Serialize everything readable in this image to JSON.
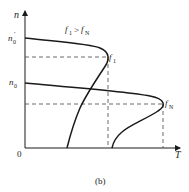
{
  "diagram": {
    "caption": "(b)",
    "axes": {
      "y_label": "n",
      "x_label": "T",
      "origin_label": "0"
    },
    "y_ticks": {
      "n0_prime": {
        "base": "n",
        "sub": "0",
        "sup": "′"
      },
      "n0": {
        "base": "n",
        "sub": "0"
      }
    },
    "condition": {
      "left": "f",
      "left_sub": "1",
      "op": ">",
      "right": "f",
      "right_sub": "N"
    },
    "curves": [
      {
        "name": "f1",
        "base": "f",
        "sub": "1"
      },
      {
        "name": "fN",
        "base": "f",
        "sub": "N"
      }
    ],
    "colors": {
      "line": "#1a1a1a",
      "dash": "#444444",
      "text": "#222222"
    }
  }
}
